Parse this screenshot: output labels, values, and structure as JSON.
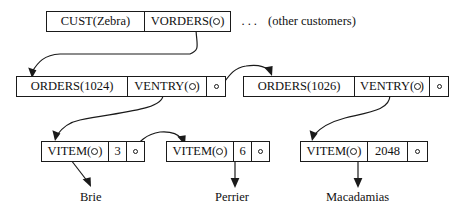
{
  "figure": {
    "type": "data-structure-pointer-diagram"
  },
  "palette": {
    "ink": "#1a1a1a",
    "background": "#ffffff"
  },
  "glyphs": {
    "pointer_key": "⚲",
    "null_dot": "○",
    "ellipsis": "···"
  },
  "nodes": {
    "cust": {
      "id": "cust-node",
      "cells": [
        {
          "name": "cust-label",
          "text": "CUST(Zebra)",
          "kind": "text"
        },
        {
          "name": "vorders-pointer",
          "prefix": "VORDERS(",
          "suffix": ")",
          "kind": "keyptr"
        }
      ]
    },
    "orders1024": {
      "id": "orders-1024-node",
      "cells": [
        {
          "name": "orders-label",
          "text": "ORDERS(1024)",
          "kind": "text"
        },
        {
          "name": "ventry-pointer",
          "prefix": "VENTRY(",
          "suffix": ")",
          "kind": "keyptr"
        },
        {
          "name": "next-order-pointer",
          "text": "",
          "kind": "ptrdot"
        }
      ]
    },
    "orders1026": {
      "id": "orders-1026-node",
      "cells": [
        {
          "name": "orders-label",
          "text": "ORDERS(1026)",
          "kind": "text"
        },
        {
          "name": "ventry-pointer",
          "prefix": "VENTRY(",
          "suffix": ")",
          "kind": "keyptr"
        },
        {
          "name": "next-order-pointer",
          "text": "",
          "kind": "nulldot"
        }
      ]
    },
    "vitem_brie": {
      "id": "vitem-brie-node",
      "cells": [
        {
          "name": "vitem-pointer",
          "prefix": "VITEM(",
          "suffix": ")",
          "kind": "keyptr"
        },
        {
          "name": "quantity",
          "text": "3",
          "kind": "text"
        },
        {
          "name": "next-item-pointer",
          "text": "",
          "kind": "ptrdot"
        }
      ]
    },
    "vitem_perrier": {
      "id": "vitem-perrier-node",
      "cells": [
        {
          "name": "vitem-pointer",
          "prefix": "VITEM(",
          "suffix": ")",
          "kind": "keyptr"
        },
        {
          "name": "quantity",
          "text": "6",
          "kind": "text"
        },
        {
          "name": "next-item-pointer",
          "text": "",
          "kind": "nulldot"
        }
      ]
    },
    "vitem_macadamias": {
      "id": "vitem-macadamias-node",
      "cells": [
        {
          "name": "vitem-pointer",
          "prefix": "VITEM(",
          "suffix": ")",
          "kind": "keyptr"
        },
        {
          "name": "quantity",
          "text": "2048",
          "kind": "text"
        },
        {
          "name": "next-item-pointer",
          "text": "",
          "kind": "nulldot"
        }
      ]
    }
  },
  "annotations": {
    "ellipsis": "···",
    "other_customers": "(other customers)",
    "product_brie": "Brie",
    "product_perrier": "Perrier",
    "product_macadamias": "Macadamias"
  }
}
